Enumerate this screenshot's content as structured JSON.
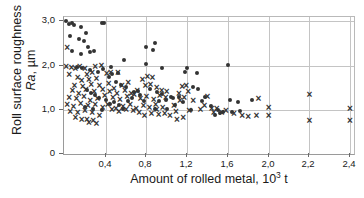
{
  "chart_data": {
    "type": "scatter",
    "title": "",
    "xlabel": "Amount of rolled metal, 10³ t",
    "ylabel_line1": "Roll surface roughness",
    "ylabel_line2": "Ra, µm",
    "ylabel_italic_part": "Ra",
    "ylabel_plain_part": ", µm",
    "xlim": [
      0.0,
      2.4
    ],
    "ylim": [
      0.0,
      3.1
    ],
    "xticks": [
      0.4,
      0.8,
      1.2,
      1.6,
      2.0,
      2.2,
      2.4
    ],
    "xtick_labels": [
      "0,4",
      "0,8",
      "1,2",
      "1,6",
      "2,0",
      "2,2",
      "2,4"
    ],
    "xtick_positions_frac": [
      0.1438,
      0.2842,
      0.4247,
      0.5651,
      0.7055,
      0.8459,
      0.9863
    ],
    "yticks": [
      0,
      1.0,
      2.0,
      3.0
    ],
    "ytick_labels": [
      "0",
      "1,0",
      "2,0",
      "3,0"
    ],
    "grid": true,
    "grid_color": "#c4c4c4",
    "marker_color": "#333333",
    "legend": [],
    "series": [
      {
        "name": "circle-series",
        "marker": "circle",
        "points": [
          [
            0.02,
            3.0
          ],
          [
            0.05,
            2.94
          ],
          [
            0.08,
            2.97
          ],
          [
            0.1,
            2.93
          ],
          [
            0.06,
            2.66
          ],
          [
            0.16,
            2.88
          ],
          [
            0.21,
            2.74
          ],
          [
            0.14,
            2.61
          ],
          [
            0.19,
            2.55
          ],
          [
            0.23,
            2.43
          ],
          [
            0.08,
            2.33
          ],
          [
            0.16,
            2.27
          ],
          [
            0.25,
            2.31
          ],
          [
            0.29,
            2.34
          ],
          [
            0.38,
            2.97
          ],
          [
            0.36,
            2.97
          ],
          [
            0.12,
            1.97
          ],
          [
            0.17,
            1.95
          ],
          [
            0.25,
            1.9
          ],
          [
            0.33,
            1.86
          ],
          [
            0.37,
            1.93
          ],
          [
            0.46,
            1.8
          ],
          [
            0.45,
            1.96
          ],
          [
            0.52,
            1.83
          ],
          [
            0.58,
            2.13
          ],
          [
            0.8,
            2.42
          ],
          [
            0.88,
            2.52
          ],
          [
            0.86,
            2.35
          ],
          [
            0.8,
            2.03
          ],
          [
            0.95,
            1.94
          ],
          [
            1.2,
            1.95
          ],
          [
            1.18,
            1.86
          ],
          [
            1.3,
            1.83
          ],
          [
            1.6,
            2.01
          ],
          [
            0.43,
            1.74
          ],
          [
            0.5,
            1.63
          ],
          [
            0.55,
            1.57
          ],
          [
            0.6,
            1.51
          ],
          [
            0.68,
            1.4
          ],
          [
            0.72,
            1.43
          ],
          [
            0.84,
            1.47
          ],
          [
            0.9,
            1.41
          ],
          [
            0.95,
            1.35
          ],
          [
            1.04,
            1.3
          ],
          [
            1.12,
            1.28
          ],
          [
            1.26,
            1.52
          ],
          [
            1.31,
            1.46
          ],
          [
            1.38,
            1.28
          ],
          [
            0.3,
            1.34
          ],
          [
            0.34,
            1.27
          ],
          [
            0.4,
            1.23
          ],
          [
            0.22,
            1.45
          ],
          [
            0.26,
            1.38
          ],
          [
            0.44,
            1.14
          ],
          [
            0.48,
            1.17
          ],
          [
            0.53,
            1.1
          ],
          [
            0.62,
            1.21
          ],
          [
            0.66,
            1.27
          ],
          [
            0.74,
            1.33
          ],
          [
            0.78,
            1.19
          ],
          [
            0.92,
            1.21
          ],
          [
            0.99,
            1.22
          ],
          [
            1.08,
            1.12
          ],
          [
            1.16,
            1.18
          ],
          [
            1.35,
            1.21
          ],
          [
            1.43,
            1.09
          ],
          [
            1.5,
            1.0
          ],
          [
            1.55,
            0.96
          ],
          [
            1.62,
            1.23
          ],
          [
            1.7,
            1.18
          ],
          [
            1.84,
            1.22
          ],
          [
            1.47,
            0.89
          ],
          [
            1.52,
            0.93
          ],
          [
            1.64,
            0.95
          ],
          [
            1.72,
            0.97
          ],
          [
            0.2,
            1.06
          ],
          [
            0.28,
            1.01
          ],
          [
            0.36,
            0.99
          ],
          [
            0.57,
            1.02
          ],
          [
            0.88,
            1.02
          ],
          [
            1.0,
            1.01
          ],
          [
            1.06,
            1.26
          ],
          [
            1.24,
            0.99
          ]
        ]
      },
      {
        "name": "cross-series",
        "marker": "x",
        "points": [
          [
            0.03,
            2.42
          ],
          [
            0.02,
            1.97
          ],
          [
            0.07,
            1.96
          ],
          [
            0.11,
            1.93
          ],
          [
            0.15,
            1.97
          ],
          [
            0.2,
            1.94
          ],
          [
            0.3,
            1.97
          ],
          [
            0.36,
            2.0
          ],
          [
            0.05,
            1.8
          ],
          [
            0.13,
            1.74
          ],
          [
            0.22,
            1.81
          ],
          [
            0.27,
            1.84
          ],
          [
            0.17,
            1.67
          ],
          [
            0.24,
            1.68
          ],
          [
            0.31,
            1.7
          ],
          [
            0.41,
            1.82
          ],
          [
            0.45,
            1.85
          ],
          [
            0.52,
            1.84
          ],
          [
            0.1,
            1.56
          ],
          [
            0.18,
            1.53
          ],
          [
            0.26,
            1.57
          ],
          [
            0.34,
            1.55
          ],
          [
            0.43,
            1.6
          ],
          [
            0.48,
            1.49
          ],
          [
            0.56,
            1.55
          ],
          [
            0.62,
            1.61
          ],
          [
            0.08,
            1.43
          ],
          [
            0.14,
            1.38
          ],
          [
            0.21,
            1.45
          ],
          [
            0.29,
            1.42
          ],
          [
            0.37,
            1.47
          ],
          [
            0.44,
            1.41
          ],
          [
            0.51,
            1.38
          ],
          [
            0.59,
            1.44
          ],
          [
            0.65,
            1.37
          ],
          [
            0.71,
            1.43
          ],
          [
            0.76,
            1.68
          ],
          [
            0.81,
            1.75
          ],
          [
            0.86,
            1.73
          ],
          [
            0.79,
            1.55
          ],
          [
            0.84,
            1.58
          ],
          [
            0.9,
            1.5
          ],
          [
            0.95,
            1.44
          ],
          [
            1.0,
            1.42
          ],
          [
            0.05,
            1.28
          ],
          [
            0.12,
            1.25
          ],
          [
            0.19,
            1.3
          ],
          [
            0.25,
            1.22
          ],
          [
            0.32,
            1.26
          ],
          [
            0.39,
            1.33
          ],
          [
            0.47,
            1.28
          ],
          [
            0.54,
            1.24
          ],
          [
            0.61,
            1.29
          ],
          [
            0.68,
            1.34
          ],
          [
            0.74,
            1.26
          ],
          [
            0.8,
            1.31
          ],
          [
            0.87,
            1.23
          ],
          [
            0.93,
            1.33
          ],
          [
            0.99,
            1.27
          ],
          [
            0.03,
            1.12
          ],
          [
            0.09,
            1.08
          ],
          [
            0.16,
            1.14
          ],
          [
            0.23,
            1.09
          ],
          [
            0.3,
            1.13
          ],
          [
            0.37,
            1.05
          ],
          [
            0.42,
            1.11
          ],
          [
            0.5,
            1.03
          ],
          [
            0.57,
            1.08
          ],
          [
            0.64,
            1.13
          ],
          [
            0.7,
            1.04
          ],
          [
            0.77,
            1.1
          ],
          [
            0.83,
            1.06
          ],
          [
            0.89,
            1.12
          ],
          [
            0.96,
            1.05
          ],
          [
            0.06,
            0.97
          ],
          [
            0.13,
            0.93
          ],
          [
            0.2,
            0.99
          ],
          [
            0.27,
            0.95
          ],
          [
            0.34,
            0.88
          ],
          [
            0.46,
            1.0
          ],
          [
            0.53,
            0.96
          ],
          [
            0.6,
            1.01
          ],
          [
            0.67,
            0.99
          ],
          [
            0.73,
            0.94
          ],
          [
            0.11,
            0.82
          ],
          [
            0.17,
            0.78
          ],
          [
            0.24,
            0.72
          ],
          [
            0.31,
            0.7
          ],
          [
            0.22,
            0.79
          ],
          [
            0.28,
            0.76
          ],
          [
            0.92,
            0.9
          ],
          [
            0.98,
            0.92
          ],
          [
            1.03,
            0.88
          ],
          [
            1.09,
            0.97
          ],
          [
            1.07,
            1.1
          ],
          [
            1.13,
            1.22
          ],
          [
            1.12,
            1.36
          ],
          [
            1.15,
            1.52
          ],
          [
            1.19,
            1.56
          ],
          [
            1.21,
            1.42
          ],
          [
            1.17,
            1.27
          ],
          [
            1.1,
            0.78
          ],
          [
            1.16,
            0.82
          ],
          [
            1.22,
            0.98
          ],
          [
            1.26,
            1.21
          ],
          [
            1.33,
            1.01
          ],
          [
            1.4,
            1.29
          ],
          [
            1.37,
            1.1
          ],
          [
            1.44,
            1.02
          ],
          [
            1.49,
            1.03
          ],
          [
            1.46,
            0.95
          ],
          [
            1.54,
            0.93
          ],
          [
            1.58,
            0.98
          ],
          [
            1.66,
            0.91
          ],
          [
            1.74,
            0.86
          ],
          [
            1.8,
            0.84
          ],
          [
            1.88,
            0.87
          ],
          [
            1.9,
            1.25
          ],
          [
            2.0,
            1.06
          ],
          [
            2.0,
            0.88
          ],
          [
            2.2,
            1.35
          ],
          [
            2.2,
            0.76
          ],
          [
            2.4,
            1.02
          ],
          [
            2.4,
            0.75
          ],
          [
            0.9,
            1.0
          ],
          [
            0.85,
            0.92
          ],
          [
            0.78,
            0.86
          ]
        ]
      }
    ]
  }
}
